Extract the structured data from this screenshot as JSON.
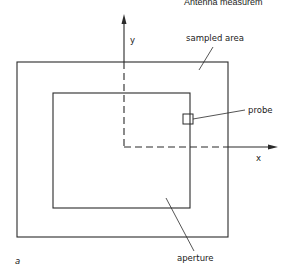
{
  "header": {
    "running_title": "Antenna measurem"
  },
  "diagram": {
    "axes": {
      "x_label": "x",
      "y_label": "y"
    },
    "labels": {
      "sampled_area": "sampled area",
      "probe": "probe",
      "aperture": "aperture",
      "panel": "a"
    },
    "colors": {
      "line": "#2a2a2a",
      "background": "#ffffff"
    }
  }
}
